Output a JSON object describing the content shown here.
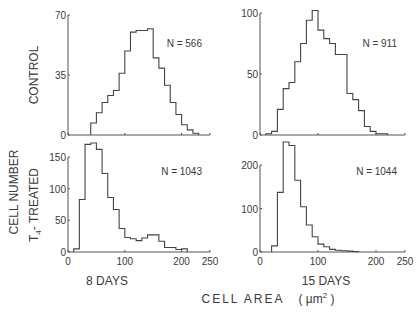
{
  "figure": {
    "ylabel": "CELL NUMBER",
    "xlabel": "CELL AREA",
    "xlabel_unit": "( µm",
    "xlabel_unit_sup": "2",
    "xlabel_unit_close": " )",
    "row_labels": [
      "CONTROL",
      "T4-TREATED"
    ],
    "row_label_treated_main": "T",
    "row_label_treated_sub": "4",
    "row_label_treated_rest": "- TREATED",
    "col_labels": [
      "8 DAYS",
      "15 DAYS"
    ]
  },
  "chart_data": [
    {
      "type": "bar",
      "title": "CONTROL, 8 DAYS",
      "annotation": "N = 566",
      "xlabel": "CELL AREA (µm²)",
      "ylabel": "CELL NUMBER",
      "xlim": [
        0,
        250
      ],
      "ylim": [
        0,
        70
      ],
      "yticks": [
        0,
        35,
        70
      ],
      "xticks": [
        0,
        100,
        200,
        250
      ],
      "xticklabels_shown": false,
      "bin_width": 10,
      "bin_start": 40,
      "values": [
        7,
        13,
        19,
        23,
        26,
        36,
        49,
        60,
        61,
        61,
        62,
        45,
        39,
        29,
        19,
        12,
        6,
        3,
        1
      ]
    },
    {
      "type": "bar",
      "title": "CONTROL, 15 DAYS",
      "annotation": "N = 911",
      "xlabel": "CELL AREA (µm²)",
      "ylabel": "CELL NUMBER",
      "xlim": [
        0,
        250
      ],
      "ylim": [
        0,
        100
      ],
      "yticks": [
        0,
        50,
        100
      ],
      "xticks": [
        0,
        100,
        200,
        250
      ],
      "xticklabels_shown": false,
      "bin_width": 10,
      "bin_start": 10,
      "values": [
        1,
        3,
        21,
        38,
        43,
        60,
        75,
        94,
        102,
        86,
        79,
        75,
        66,
        66,
        34,
        29,
        20,
        7,
        3,
        1,
        1
      ]
    },
    {
      "type": "bar",
      "title": "T4-TREATED, 8 DAYS",
      "annotation": "N = 1043",
      "xlabel": "CELL AREA (µm²)",
      "ylabel": "CELL NUMBER",
      "xlim": [
        0,
        250
      ],
      "ylim": [
        0,
        150
      ],
      "yticks": [
        0,
        50,
        100,
        150
      ],
      "xticks": [
        0,
        100,
        200,
        250
      ],
      "xticklabels": [
        "0",
        "100",
        "200",
        "250"
      ],
      "bin_width": 10,
      "bin_start": 10,
      "values": [
        5,
        83,
        170,
        172,
        162,
        124,
        86,
        67,
        37,
        23,
        21,
        18,
        22,
        27,
        27,
        17,
        7,
        7,
        4,
        5
      ]
    },
    {
      "type": "bar",
      "title": "T4-TREATED, 15 DAYS",
      "annotation": "N = 1044",
      "xlabel": "CELL AREA (µm²)",
      "ylabel": "CELL NUMBER",
      "xlim": [
        0,
        250
      ],
      "ylim": [
        0,
        250
      ],
      "yticks": [
        0,
        100,
        200
      ],
      "xticks": [
        0,
        100,
        200,
        250
      ],
      "xticklabels": [
        "0",
        "100",
        "200",
        "250"
      ],
      "bin_width": 10,
      "bin_start": 20,
      "values": [
        14,
        137,
        253,
        245,
        165,
        104,
        62,
        35,
        18,
        12,
        6,
        4,
        3,
        2,
        1
      ]
    }
  ],
  "layout": {
    "panels": [
      {
        "x0": 68,
        "x1": 210,
        "y0": 135,
        "ytop": 15,
        "ymax": 70,
        "nx": 108
      },
      {
        "x0": 260,
        "x1": 405,
        "y0": 135,
        "ytop": 13,
        "ymax": 100,
        "nx": 228
      },
      {
        "x0": 68,
        "x1": 210,
        "y0": 252,
        "ytop": 157,
        "ymax": 150,
        "nx": 107
      },
      {
        "x0": 260,
        "x1": 405,
        "y0": 252,
        "ytop": 165,
        "ymax": 200,
        "nx": 296
      }
    ]
  }
}
